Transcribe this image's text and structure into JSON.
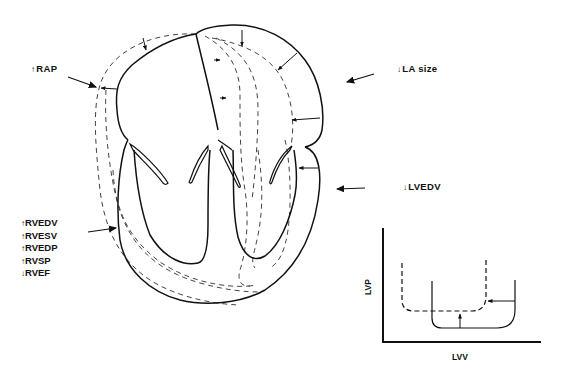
{
  "labels": {
    "rap": {
      "arrow": "↑",
      "text": "RAP"
    },
    "la_size": {
      "arrow": "↓",
      "text": "LA  size"
    },
    "lvedv": {
      "arrow": "↓",
      "text": "LVEDV"
    }
  },
  "rv_list": [
    {
      "arrow": "↑",
      "text": "RVEDV"
    },
    {
      "arrow": "↑",
      "text": "RVESV"
    },
    {
      "arrow": "↑",
      "text": "RVEDP"
    },
    {
      "arrow": "↑",
      "text": "RVSP"
    },
    {
      "arrow": "↓",
      "text": "RVEF"
    }
  ],
  "pv_loop": {
    "xlabel": "LVV",
    "ylabel": "LVP"
  },
  "colors": {
    "ink": "#111111",
    "dashed": "#444444",
    "background": "#ffffff"
  }
}
